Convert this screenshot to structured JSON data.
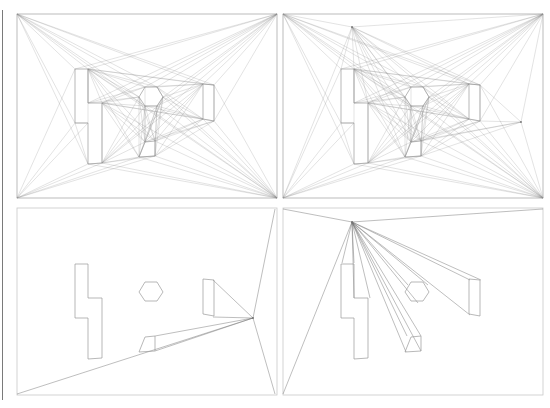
{
  "figure": {
    "title": ""
  },
  "colors": {
    "background": "#ffffff",
    "border": "#c8c8c8",
    "obstacle": "#9a9a9a",
    "edge": "#8c8c8c",
    "node": "#777777",
    "left_bar": "#7a7a7a"
  },
  "panels": [
    {
      "id": "top-left",
      "label": "full visibility graph",
      "rect": [
        17,
        14,
        260,
        184
      ],
      "offset": [
        0,
        0
      ],
      "mode": "full",
      "extra_nodes": []
    },
    {
      "id": "top-right",
      "label": "visibility graph with added start/goal",
      "rect": [
        283,
        14,
        260,
        184
      ],
      "offset": [
        266,
        0
      ],
      "mode": "full",
      "extra_nodes": [
        [
          352,
          27
        ],
        [
          521,
          122
        ]
      ]
    },
    {
      "id": "bottom-left",
      "label": "visible vertices from point",
      "rect": [
        17,
        208,
        260,
        187
      ],
      "offset": [
        0,
        195
      ],
      "mode": "star",
      "apex": [
        253,
        318
      ],
      "star_targets": [
        [
          275,
          209
        ],
        [
          275,
          394
        ],
        [
          17,
          394
        ],
        [
          155,
          336
        ],
        [
          155,
          351
        ],
        [
          213,
          280
        ],
        [
          213,
          317
        ]
      ]
    },
    {
      "id": "bottom-right",
      "label": "visible vertices from point",
      "rect": [
        283,
        208,
        260,
        187
      ],
      "offset": [
        266,
        195
      ],
      "mode": "star",
      "apex": [
        352,
        222
      ],
      "star_targets": [
        [
          283,
          209
        ],
        [
          543,
          209
        ],
        [
          283,
          394
        ],
        [
          342,
          263
        ],
        [
          354,
          263
        ],
        [
          370,
          298
        ],
        [
          354,
          298
        ],
        [
          421,
          336
        ],
        [
          407,
          336
        ],
        [
          406,
          352
        ],
        [
          421,
          351
        ],
        [
          408,
          285
        ],
        [
          428,
          285
        ],
        [
          418,
          303
        ],
        [
          470,
          280
        ],
        [
          481,
          280
        ],
        [
          470,
          315
        ]
      ]
    }
  ],
  "obstacles": [
    {
      "name": "l-shape",
      "points": [
        [
          75,
          69
        ],
        [
          88,
          69
        ],
        [
          88,
          103
        ],
        [
          102,
          103
        ],
        [
          102,
          163
        ],
        [
          88,
          164
        ],
        [
          88,
          123
        ],
        [
          75,
          123
        ]
      ]
    },
    {
      "name": "hexagon",
      "points": [
        [
          145,
          87
        ],
        [
          157,
          87
        ],
        [
          163,
          97
        ],
        [
          157,
          106
        ],
        [
          145,
          106
        ],
        [
          139,
          97
        ]
      ]
    },
    {
      "name": "right-quad",
      "points": [
        [
          203,
          84
        ],
        [
          214,
          85
        ],
        [
          214,
          121
        ],
        [
          203,
          119
        ]
      ]
    },
    {
      "name": "small-quad",
      "points": [
        [
          145,
          142
        ],
        [
          155,
          141
        ],
        [
          155,
          156
        ],
        [
          139,
          157
        ]
      ]
    }
  ],
  "bottom_obstacle_shift": [
    [
      0,
      195
    ]
  ],
  "corners_top": [
    [
      17,
      14
    ],
    [
      277,
      14
    ],
    [
      17,
      198
    ],
    [
      277,
      198
    ]
  ]
}
